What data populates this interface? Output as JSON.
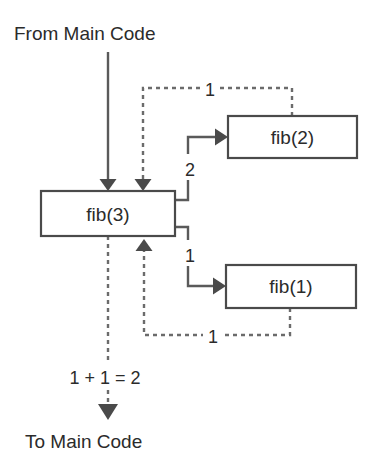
{
  "diagram": {
    "colors": {
      "background": "#ffffff",
      "box_stroke": "#4a4a4a",
      "box_fill": "#ffffff",
      "solid_edge": "#5a5a5a",
      "dashed_edge": "#6b6b6b",
      "text": "#2b2b2b"
    },
    "captions": {
      "top": "From Main Code",
      "bottom": "To Main Code",
      "sum": "1 + 1 = 2"
    },
    "nodes": [
      {
        "id": "fib3",
        "label": "fib(3)"
      },
      {
        "id": "fib2",
        "label": "fib(2)"
      },
      {
        "id": "fib1",
        "label": "fib(1)"
      }
    ],
    "edges": [
      {
        "id": "main-to-fib3",
        "style": "solid",
        "label": ""
      },
      {
        "id": "fib3-to-fib2",
        "style": "solid",
        "label": "2"
      },
      {
        "id": "fib3-to-fib1",
        "style": "solid",
        "label": "1"
      },
      {
        "id": "fib2-return",
        "style": "dashed",
        "label": "1"
      },
      {
        "id": "fib1-return",
        "style": "dashed",
        "label": "1"
      },
      {
        "id": "fib3-to-main",
        "style": "dashed",
        "label": "1 + 1 = 2"
      }
    ]
  }
}
